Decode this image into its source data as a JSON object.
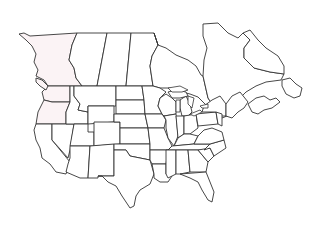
{
  "map": {
    "type": "outline-map",
    "subject": "North America — US states and Canadian provinces (blank outline)",
    "background": "#ffffff",
    "stroke_color": "#333333",
    "tint_color": "#fbf3f5",
    "labels": [],
    "regions": [
      {
        "id": "british-columbia",
        "tinted": true
      },
      {
        "id": "alberta",
        "tinted": false
      },
      {
        "id": "saskatchewan",
        "tinted": false
      },
      {
        "id": "manitoba",
        "tinted": false
      },
      {
        "id": "ontario",
        "tinted": false
      },
      {
        "id": "quebec",
        "tinted": false
      },
      {
        "id": "newfoundland-labrador",
        "tinted": false
      },
      {
        "id": "maritimes",
        "tinted": false
      },
      {
        "id": "washington",
        "tinted": true
      },
      {
        "id": "oregon",
        "tinted": true
      },
      {
        "id": "california",
        "tinted": false
      },
      {
        "id": "conterminous-us-states",
        "tinted": false
      }
    ]
  }
}
